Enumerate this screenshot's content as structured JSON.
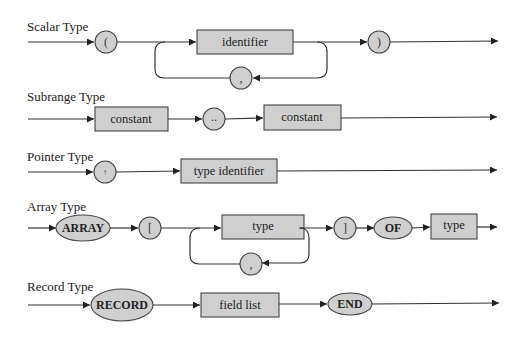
{
  "diagram": {
    "colors": {
      "node_fill": "#cfcfcf",
      "stroke": "#444444",
      "background": "#ffffff"
    },
    "sections": [
      {
        "title": "Scalar Type",
        "nodes": [
          {
            "kind": "circle",
            "text": "("
          },
          {
            "kind": "box",
            "text": "identifier"
          },
          {
            "kind": "circle",
            "text": ",",
            "role": "loop-back separator"
          },
          {
            "kind": "circle",
            "text": ")"
          }
        ]
      },
      {
        "title": "Subrange Type",
        "nodes": [
          {
            "kind": "box",
            "text": "constant"
          },
          {
            "kind": "circle",
            "text": ".."
          },
          {
            "kind": "box",
            "text": "constant"
          }
        ]
      },
      {
        "title": "Pointer Type",
        "nodes": [
          {
            "kind": "circle",
            "text": "↑"
          },
          {
            "kind": "box",
            "text": "type identifier"
          }
        ]
      },
      {
        "title": "Array Type",
        "nodes": [
          {
            "kind": "ellipse",
            "text": "ARRAY"
          },
          {
            "kind": "circle",
            "text": "["
          },
          {
            "kind": "box",
            "text": "type"
          },
          {
            "kind": "circle",
            "text": ",",
            "role": "loop-back separator"
          },
          {
            "kind": "circle",
            "text": "]"
          },
          {
            "kind": "ellipse",
            "text": "OF"
          },
          {
            "kind": "box",
            "text": "type"
          }
        ]
      },
      {
        "title": "Record Type",
        "nodes": [
          {
            "kind": "ellipse",
            "text": "RECORD"
          },
          {
            "kind": "box",
            "text": "field list"
          },
          {
            "kind": "ellipse",
            "text": "END"
          }
        ]
      }
    ]
  }
}
